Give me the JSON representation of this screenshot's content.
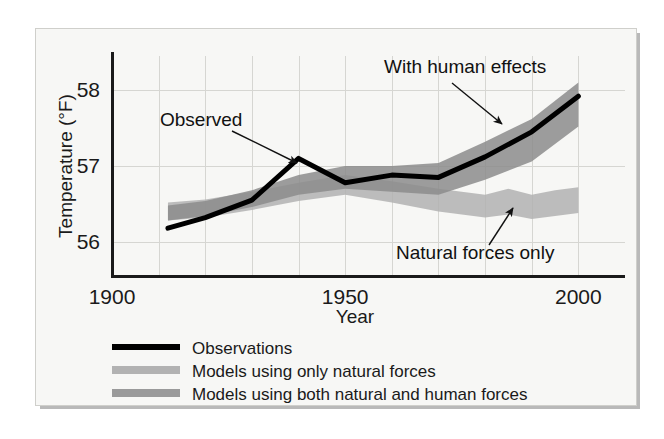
{
  "figure": {
    "background": "#f7f7f5",
    "page_background": "#ffffff"
  },
  "chart_data": {
    "type": "line",
    "title": "",
    "xlabel": "Year",
    "ylabel": "Temperature (°F)",
    "xlim": [
      1900,
      2010
    ],
    "ylim": [
      55.55,
      58.45
    ],
    "xticks": [
      1900,
      1950,
      2000
    ],
    "xtick_labels": [
      "1900",
      "1950",
      "2000"
    ],
    "yticks": [
      56,
      57,
      58
    ],
    "ytick_labels": [
      "56",
      "57",
      "58"
    ],
    "x_minor_gridline_step": 10,
    "grid": true,
    "grid_color": "#d6d6d2",
    "legend_position": "below-axes-left",
    "series": [
      {
        "name": "Observations",
        "kind": "line",
        "color": "#000000",
        "linewidth": 5,
        "x": [
          1912,
          1920,
          1930,
          1940,
          1950,
          1960,
          1970,
          1980,
          1990,
          2000
        ],
        "values": [
          56.18,
          56.32,
          56.55,
          57.1,
          56.78,
          56.88,
          56.85,
          57.12,
          57.45,
          57.92
        ]
      },
      {
        "name": "Models using only natural forces",
        "kind": "band",
        "color": "#b2b2b2",
        "opacity": 0.85,
        "x": [
          1912,
          1920,
          1930,
          1940,
          1950,
          1960,
          1970,
          1980,
          1985,
          1990,
          1995,
          2000
        ],
        "upper": [
          56.52,
          56.56,
          56.66,
          56.78,
          56.88,
          56.8,
          56.7,
          56.62,
          56.7,
          56.62,
          56.68,
          56.72
        ],
        "lower": [
          56.28,
          56.32,
          56.42,
          56.54,
          56.62,
          56.52,
          56.4,
          56.32,
          56.36,
          56.3,
          56.34,
          56.38
        ]
      },
      {
        "name": "Models using both natural and human forces",
        "kind": "band",
        "color": "#8c8c8c",
        "opacity": 0.85,
        "x": [
          1912,
          1920,
          1930,
          1940,
          1950,
          1960,
          1970,
          1980,
          1990,
          2000
        ],
        "upper": [
          56.48,
          56.54,
          56.68,
          56.88,
          57.0,
          57.0,
          57.04,
          57.32,
          57.62,
          58.1
        ],
        "lower": [
          56.28,
          56.34,
          56.46,
          56.62,
          56.7,
          56.66,
          56.62,
          56.82,
          57.06,
          57.52
        ]
      }
    ],
    "annotations": [
      {
        "text": "Observed",
        "text_x": 160,
        "text_y": 126,
        "arrow_from_x": 232,
        "arrow_from_y": 131,
        "arrow_to_x": 297,
        "arrow_to_y": 163
      },
      {
        "text": "With human effects",
        "text_x": 384,
        "text_y": 73,
        "arrow_from_x": 452,
        "arrow_from_y": 83,
        "arrow_to_x": 502,
        "arrow_to_y": 124
      },
      {
        "text": "Natural forces only",
        "text_x": 396,
        "text_y": 259,
        "arrow_from_x": 489,
        "arrow_from_y": 245,
        "arrow_to_x": 513,
        "arrow_to_y": 208
      }
    ],
    "legend_entries": [
      {
        "label": "Observations",
        "swatch": "solid-line",
        "color": "#000000"
      },
      {
        "label": "Models using only natural forces",
        "swatch": "band",
        "color": "#b2b2b2"
      },
      {
        "label": "Models using both natural and human forces",
        "swatch": "band",
        "color": "#9a9a9a"
      }
    ]
  }
}
